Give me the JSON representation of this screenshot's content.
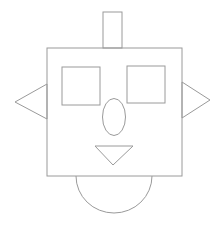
{
  "figure": {
    "width": 224,
    "height": 231,
    "background": "#ffffff",
    "stroke_color": "#9a9a9a"
  },
  "shapes": {
    "antenna": {
      "type": "rect",
      "x": 103,
      "y": 12,
      "w": 19,
      "h": 36
    },
    "head": {
      "type": "rect",
      "x": 47,
      "y": 48,
      "w": 135,
      "h": 128
    },
    "left_eye": {
      "type": "rect",
      "x": 62,
      "y": 67,
      "w": 38,
      "h": 38
    },
    "right_eye": {
      "type": "rect",
      "x": 127,
      "y": 66,
      "w": 38,
      "h": 37
    },
    "nose": {
      "type": "ellipse",
      "cx": 114,
      "cy": 117,
      "rx": 11.5,
      "ry": 18.5
    },
    "mouth": {
      "type": "triangle",
      "points": "95,146 133,146 113,165"
    },
    "left_ear": {
      "type": "triangle",
      "points": "47,84 15,102 47,119"
    },
    "right_ear": {
      "type": "triangle",
      "points": "182,82 210,100 182,118"
    },
    "chin": {
      "type": "semicircle",
      "cx": 114,
      "cy": 176,
      "r": 38,
      "ry": 37
    }
  }
}
